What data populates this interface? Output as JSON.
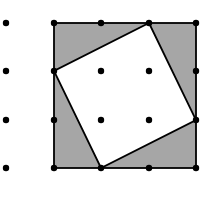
{
  "diagram": {
    "type": "geoboard-tilted-square",
    "width": 211,
    "height": 204,
    "colors": {
      "background": "#ffffff",
      "shade": "#a6a6a6",
      "line": "#000000",
      "dot": "#000000"
    },
    "grid": {
      "columns_x": [
        6,
        54,
        101,
        149,
        196
      ],
      "rows_y": [
        23,
        71,
        120,
        168
      ],
      "dot_radius": 3.2,
      "dots_hidden_under_white": []
    },
    "outer_square": {
      "x1": 54,
      "y1": 23,
      "x2": 196,
      "y2": 168,
      "label": "outer square (3x3 units)"
    },
    "inner_square": {
      "points": [
        [
          149,
          23
        ],
        [
          196,
          120
        ],
        [
          101,
          168
        ],
        [
          54,
          71
        ]
      ],
      "label": "tilted inner square"
    },
    "line_width": 1.8
  }
}
